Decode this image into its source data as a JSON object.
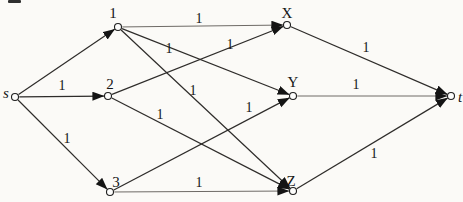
{
  "page": {
    "background": "#fbfaf7"
  },
  "diagram": {
    "canvas": {
      "width": 463,
      "height": 202
    },
    "colors": {
      "ink": "#1f1f1f",
      "edge_default": "#2e2c2a",
      "edge_light": "#6e6a66",
      "node_fill": "#fdfdfc",
      "arrowhead": "#141414"
    },
    "node_radius": 3.5,
    "nodes": [
      {
        "id": "s",
        "label": "s",
        "x": 15,
        "y": 97,
        "label_x": 6,
        "label_y": 93,
        "italic": true
      },
      {
        "id": "1",
        "label": "1",
        "x": 118,
        "y": 27,
        "label_x": 113,
        "label_y": 13,
        "italic": false
      },
      {
        "id": "2",
        "label": "2",
        "x": 108,
        "y": 96,
        "label_x": 110,
        "label_y": 84,
        "italic": false
      },
      {
        "id": "3",
        "label": "3",
        "x": 110,
        "y": 192,
        "label_x": 116,
        "label_y": 182,
        "italic": false
      },
      {
        "id": "X",
        "label": "X",
        "x": 287,
        "y": 25,
        "label_x": 287,
        "label_y": 13,
        "italic": false
      },
      {
        "id": "Y",
        "label": "Y",
        "x": 293,
        "y": 96,
        "label_x": 293,
        "label_y": 82,
        "italic": false
      },
      {
        "id": "Z",
        "label": "Z",
        "x": 293,
        "y": 191,
        "label_x": 291,
        "label_y": 181,
        "italic": false
      },
      {
        "id": "t",
        "label": "t",
        "x": 451,
        "y": 96,
        "label_x": 460,
        "label_y": 97,
        "italic": true
      }
    ],
    "edges": [
      {
        "from": "s",
        "to": "1",
        "label": ""
      },
      {
        "from": "s",
        "to": "2",
        "label": "1",
        "label_x": 62,
        "label_y": 85
      },
      {
        "from": "s",
        "to": "3",
        "label": "1",
        "label_x": 67,
        "label_y": 138
      },
      {
        "from": "1",
        "to": "X",
        "label": "1",
        "label_x": 199,
        "label_y": 18,
        "light": true
      },
      {
        "from": "1",
        "to": "Y",
        "label": "1",
        "label_x": 169,
        "label_y": 48
      },
      {
        "from": "1",
        "to": "Z",
        "label": "1",
        "label_x": 193,
        "label_y": 90
      },
      {
        "from": "2",
        "to": "X",
        "label": "1",
        "label_x": 230,
        "label_y": 44
      },
      {
        "from": "2",
        "to": "Z",
        "label": "1",
        "label_x": 160,
        "label_y": 114
      },
      {
        "from": "3",
        "to": "Y",
        "label": "1",
        "label_x": 249,
        "label_y": 107
      },
      {
        "from": "3",
        "to": "Z",
        "label": "1",
        "label_x": 199,
        "label_y": 182,
        "light": true
      },
      {
        "from": "X",
        "to": "t",
        "label": "1",
        "label_x": 366,
        "label_y": 47
      },
      {
        "from": "Y",
        "to": "t",
        "label": "1",
        "label_x": 356,
        "label_y": 84,
        "light": true
      },
      {
        "from": "Z",
        "to": "t",
        "label": "1",
        "label_x": 374,
        "label_y": 153
      }
    ],
    "scan_artifact": {
      "x": 8,
      "y": 0,
      "width": 13,
      "height": 3,
      "color": "#2f2f2f"
    }
  }
}
